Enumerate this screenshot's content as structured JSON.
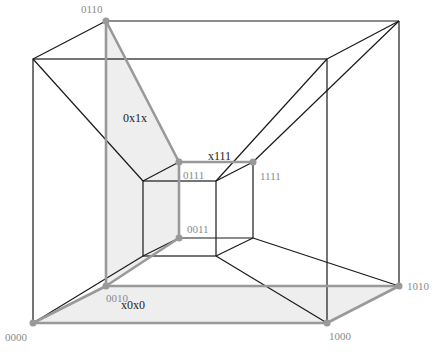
{
  "diagram": {
    "type": "tesseract-projection",
    "colors": {
      "edge": "#1a1a1a",
      "highlight_edge": "#999999",
      "highlight_fill": "#eeeeee",
      "vertex": "#999999",
      "vertex_label": "#8a8a8a",
      "face_label": "#222222"
    },
    "vertices": [
      {
        "id": "0000",
        "label": "0000",
        "x": 33,
        "y": 323,
        "highlighted": true
      },
      {
        "id": "1000",
        "label": "1000",
        "x": 327,
        "y": 323,
        "highlighted": true
      },
      {
        "id": "0010",
        "label": "0010",
        "x": 106,
        "y": 286,
        "highlighted": true
      },
      {
        "id": "1010",
        "label": "1010",
        "x": 399,
        "y": 286,
        "highlighted": true
      },
      {
        "id": "0110",
        "label": "0110",
        "x": 106,
        "y": 21,
        "highlighted": true
      },
      {
        "id": "0111",
        "label": "0111",
        "x": 179,
        "y": 162,
        "highlighted": true
      },
      {
        "id": "1111",
        "label": "1111",
        "x": 253,
        "y": 162,
        "highlighted": true
      },
      {
        "id": "0011",
        "label": "0011",
        "x": 179,
        "y": 238,
        "highlighted": true
      }
    ],
    "face_labels": [
      {
        "id": "0x1x",
        "label": "0x1x",
        "x": 123,
        "y": 118
      },
      {
        "id": "x111",
        "label": "x111",
        "x": 208,
        "y": 157
      },
      {
        "id": "x0x0",
        "label": "x0x0",
        "x": 121,
        "y": 305
      }
    ]
  }
}
